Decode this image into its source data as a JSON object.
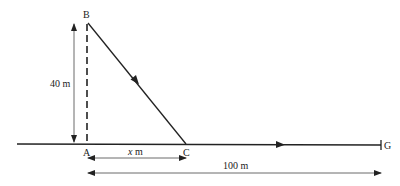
{
  "labels": {
    "B": "B",
    "A": "A",
    "C": "C",
    "G": "G",
    "height": "40 m",
    "x_dist_var": "x",
    "x_dist_unit": " m",
    "total": "100 m"
  },
  "colors": {
    "line": "#222222",
    "thin": "#444444"
  }
}
